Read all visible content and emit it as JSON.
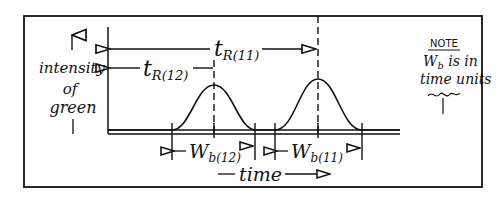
{
  "diagram": {
    "y_axis": {
      "label_line1": "intensity",
      "label_line2": "of",
      "label_line3": "green"
    },
    "x_axis": {
      "label": "time"
    },
    "retention_times": [
      {
        "id": "tR12",
        "symbol": "t",
        "subscript": "R(12)"
      },
      {
        "id": "tR11",
        "symbol": "t",
        "subscript": "R(11)"
      }
    ],
    "peak_widths": [
      {
        "id": "Wb12",
        "symbol": "W",
        "subscript": "b(12)"
      },
      {
        "id": "Wb11",
        "symbol": "W",
        "subscript": "b(11)"
      }
    ],
    "note": {
      "heading": "NOTE",
      "line1_symbol": "W",
      "line1_subscript": "b",
      "line1_rest": " is in",
      "line2": "time units"
    },
    "colors": {
      "ink": "#111111",
      "background": "#ffffff"
    }
  }
}
